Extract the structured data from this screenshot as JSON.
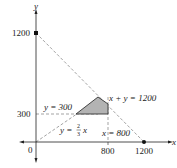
{
  "diagram": {
    "type": "linear-programming-feasible-region",
    "axes": {
      "x_label": "x",
      "y_label": "y",
      "origin_label": "0",
      "x_ticks": [
        "800",
        "1200"
      ],
      "y_ticks": [
        "300",
        "1200"
      ]
    },
    "lines": {
      "sum_line": "x + y = 1200",
      "horizontal_line": "y = 300",
      "vertical_line": "x = 800",
      "ray_line_prefix": "y =",
      "ray_line_num": "2",
      "ray_line_den": "3",
      "ray_line_var": "x"
    },
    "region": {
      "vertices": [
        [
          450,
          300
        ],
        [
          600,
          600
        ],
        [
          800,
          400
        ],
        [
          800,
          300
        ]
      ],
      "fill": "#b3b3b3"
    },
    "colors": {
      "axis": "#222222",
      "dashed": "#999999",
      "region_fill": "#b3b3b3",
      "region_stroke": "#333333"
    }
  }
}
